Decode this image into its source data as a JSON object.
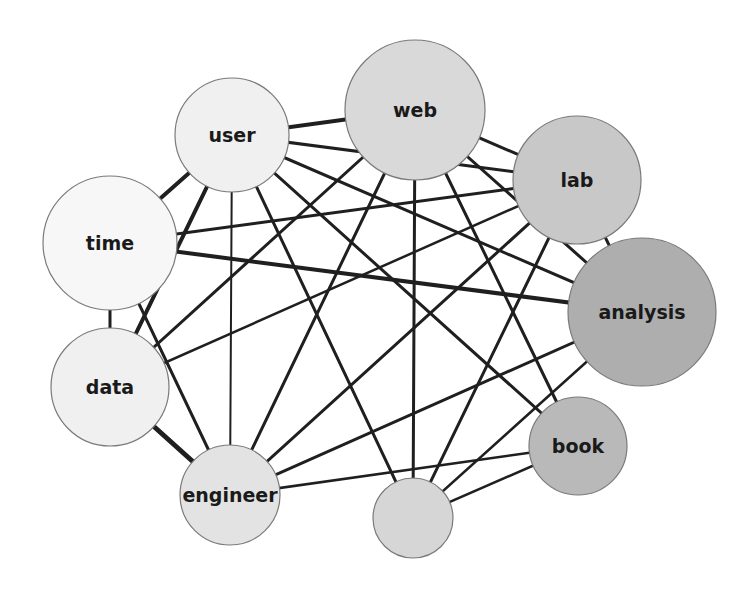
{
  "diagram": {
    "type": "network-graph",
    "nodes": [
      {
        "id": "web",
        "label": "web",
        "x": 415,
        "y": 110,
        "r": 70,
        "fill": "#d9d9d9"
      },
      {
        "id": "user",
        "label": "user",
        "x": 232,
        "y": 135,
        "r": 57,
        "fill": "#f0f0f0"
      },
      {
        "id": "lab",
        "label": "lab",
        "x": 577,
        "y": 180,
        "r": 64,
        "fill": "#c8c8c8"
      },
      {
        "id": "time",
        "label": "time",
        "x": 110,
        "y": 243,
        "r": 67,
        "fill": "#f7f7f7"
      },
      {
        "id": "analysis",
        "label": "analysis",
        "x": 642,
        "y": 312,
        "r": 74,
        "fill": "#aeaeae"
      },
      {
        "id": "data",
        "label": "data",
        "x": 110,
        "y": 387,
        "r": 59,
        "fill": "#f0f0f0"
      },
      {
        "id": "book",
        "label": "book",
        "x": 578,
        "y": 446,
        "r": 49,
        "fill": "#b9b9b9"
      },
      {
        "id": "engineer",
        "label": "engineer",
        "x": 230,
        "y": 495,
        "r": 50,
        "fill": "#e3e3e3"
      },
      {
        "id": "unlabeled",
        "label": "",
        "x": 413,
        "y": 518,
        "r": 40,
        "fill": "#d6d6d6"
      }
    ],
    "edges": [
      {
        "source": "user",
        "target": "web",
        "width": 4
      },
      {
        "source": "user",
        "target": "lab",
        "width": 3
      },
      {
        "source": "user",
        "target": "analysis",
        "width": 3
      },
      {
        "source": "user",
        "target": "book",
        "width": 3
      },
      {
        "source": "user",
        "target": "unlabeled",
        "width": 3
      },
      {
        "source": "user",
        "target": "engineer",
        "width": 2
      },
      {
        "source": "user",
        "target": "time",
        "width": 4
      },
      {
        "source": "user",
        "target": "data",
        "width": 4
      },
      {
        "source": "time",
        "target": "data",
        "width": 3
      },
      {
        "source": "time",
        "target": "lab",
        "width": 3
      },
      {
        "source": "time",
        "target": "analysis",
        "width": 4
      },
      {
        "source": "time",
        "target": "engineer",
        "width": 3
      },
      {
        "source": "data",
        "target": "web",
        "width": 3
      },
      {
        "source": "data",
        "target": "lab",
        "width": 2.5
      },
      {
        "source": "data",
        "target": "engineer",
        "width": 5
      },
      {
        "source": "engineer",
        "target": "web",
        "width": 3
      },
      {
        "source": "engineer",
        "target": "lab",
        "width": 3
      },
      {
        "source": "engineer",
        "target": "analysis",
        "width": 3
      },
      {
        "source": "engineer",
        "target": "book",
        "width": 2.5
      },
      {
        "source": "web",
        "target": "lab",
        "width": 3
      },
      {
        "source": "web",
        "target": "book",
        "width": 3
      },
      {
        "source": "web",
        "target": "unlabeled",
        "width": 3
      },
      {
        "source": "web",
        "target": "analysis",
        "width": 3
      },
      {
        "source": "lab",
        "target": "analysis",
        "width": 3
      },
      {
        "source": "lab",
        "target": "unlabeled",
        "width": 3
      },
      {
        "source": "analysis",
        "target": "unlabeled",
        "width": 2.5
      },
      {
        "source": "book",
        "target": "unlabeled",
        "width": 2.5
      }
    ]
  },
  "labels": {
    "web": "web",
    "user": "user",
    "lab": "lab",
    "time": "time",
    "analysis": "analysis",
    "data": "data",
    "book": "book",
    "engineer": "engineer",
    "unlabeled": ""
  }
}
